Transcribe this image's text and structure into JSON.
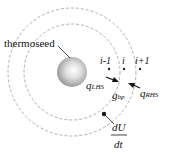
{
  "diagram": {
    "thermoseed_label": "thermoseed",
    "node_labels": [
      "i-1",
      "i",
      "i+1"
    ],
    "q_lhs": {
      "symbol": "q",
      "subscript": "LHS"
    },
    "q_rhs": {
      "symbol": "q",
      "subscript": "RHS"
    },
    "g_bp": {
      "symbol": "g",
      "subscript": "bp"
    },
    "dU_dt": {
      "numerator": "dU",
      "denominator": "dt"
    },
    "colors": {
      "dashed_circle": "#999999",
      "sphere": "#c8c8c8",
      "text": "#111111"
    }
  }
}
